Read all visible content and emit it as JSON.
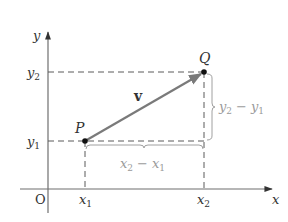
{
  "figure": {
    "type": "vector-components-diagram",
    "colors": {
      "axis": "#6f6f6f",
      "vector": "#7a7a7a",
      "dashed": "#5a5a5a",
      "brace": "#a0a0a0",
      "point": "#111111",
      "label": "#333333",
      "label_muted": "#9a9a9a"
    },
    "axes": {
      "x_label": "x",
      "y_label": "y",
      "origin_label": "O"
    },
    "ticks": {
      "x1": {
        "base": "x",
        "sub": "1"
      },
      "x2": {
        "base": "x",
        "sub": "2"
      },
      "y1": {
        "base": "y",
        "sub": "1"
      },
      "y2": {
        "base": "y",
        "sub": "2"
      }
    },
    "points": {
      "P": {
        "label": "P"
      },
      "Q": {
        "label": "Q"
      }
    },
    "vector": {
      "label": "v",
      "from": "P",
      "to": "Q"
    },
    "components": {
      "horizontal": {
        "a": {
          "base": "x",
          "sub": "2"
        },
        "op": "−",
        "b": {
          "base": "x",
          "sub": "1"
        }
      },
      "vertical": {
        "a": {
          "base": "y",
          "sub": "2"
        },
        "op": "−",
        "b": {
          "base": "y",
          "sub": "1"
        }
      }
    }
  }
}
